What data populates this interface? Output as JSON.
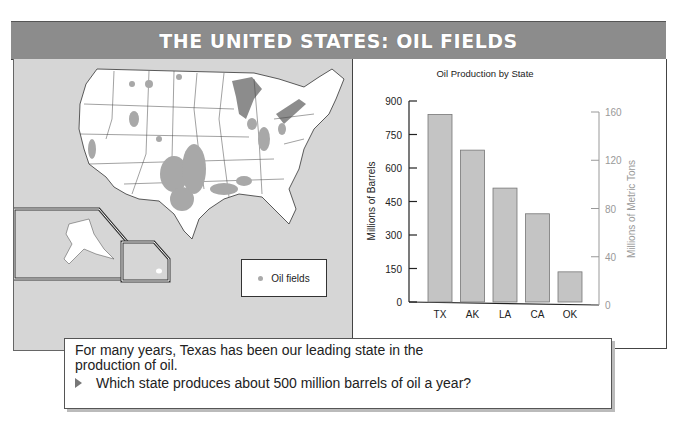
{
  "header": {
    "title": "THE UNITED STATES: OIL FIELDS"
  },
  "map": {
    "legend": {
      "label": "Oil fields",
      "symbol": "gray-dot"
    },
    "insets": [
      "Alaska",
      "Hawaii"
    ],
    "colors": {
      "land": "#ffffff",
      "water": "#d6d6d6",
      "lakes": "#8c8c8c",
      "oil_fields": "#aaaaaa"
    }
  },
  "chart_data": {
    "type": "bar",
    "title": "Oil Production by State",
    "categories": [
      "TX",
      "AK",
      "LA",
      "CA",
      "OK"
    ],
    "series": [
      {
        "name": "Oil production (millions of barrels)",
        "values": [
          840,
          680,
          510,
          395,
          135
        ]
      }
    ],
    "xlabel": "",
    "ylabel": "Millions of Barrels",
    "ylim": [
      0,
      900
    ],
    "yticks": [
      0,
      150,
      300,
      450,
      600,
      750,
      900
    ],
    "y2label": "Millions of Metric Tons",
    "y2lim": [
      0,
      160
    ],
    "y2ticks": [
      0,
      40,
      80,
      120,
      160
    ],
    "grid": false,
    "bar_color": "#c4c4c4"
  },
  "caption": {
    "text": "For many years, Texas has been our leading state in the production of oil.",
    "question": "Which state produces about 500 million barrels of oil a year?"
  }
}
